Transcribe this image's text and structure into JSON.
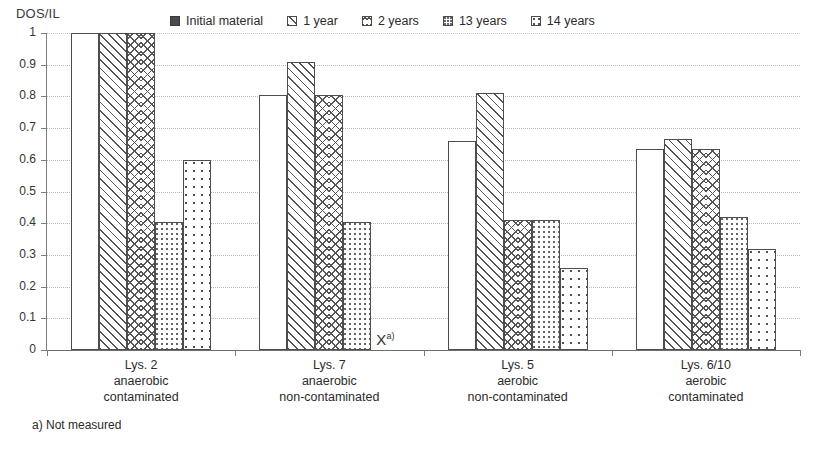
{
  "chart_data": {
    "type": "bar",
    "title": "",
    "ylabel": "DOS/IL",
    "xlabel": "",
    "ylim": [
      0,
      1
    ],
    "ytick_labels": [
      "1",
      "0.9",
      "0.8",
      "0.7",
      "0.6",
      "0.5",
      "0.4",
      "0.3",
      "0.2",
      "0.1",
      "0"
    ],
    "ytick_values": [
      1,
      0.9,
      0.8,
      0.7,
      0.6,
      0.5,
      0.4,
      0.3,
      0.2,
      0.1,
      0
    ],
    "grid": true,
    "grid_style": "dotted-horizontal",
    "legend_position": "top",
    "categories": [
      "Lys. 2 anaerobic contaminated",
      "Lys. 7 anaerobic non-contaminated",
      "Lys. 5 aerobic non-contaminated",
      "Lys. 6/10 aerobic contaminated"
    ],
    "category_lines": [
      [
        "Lys. 2",
        "anaerobic",
        "contaminated"
      ],
      [
        "Lys. 7",
        "anaerobic",
        "non-contaminated"
      ],
      [
        "Lys. 5",
        "aerobic",
        "non-contaminated"
      ],
      [
        "Lys. 6/10",
        "aerobic",
        "contaminated"
      ]
    ],
    "series": [
      {
        "name": "Initial material",
        "pattern": "solid-dark",
        "values": [
          1.0,
          0.805,
          0.66,
          0.635
        ]
      },
      {
        "name": "1 year",
        "pattern": "diagonal-hatch",
        "values": [
          1.0,
          0.91,
          0.81,
          0.665
        ]
      },
      {
        "name": "2 years",
        "pattern": "chevron-hatch",
        "values": [
          1.0,
          0.805,
          0.41,
          0.635
        ]
      },
      {
        "name": "13 years",
        "pattern": "speckle",
        "values": [
          0.405,
          0.405,
          0.41,
          0.42
        ]
      },
      {
        "name": "14 years",
        "pattern": "dots",
        "values": [
          0.6,
          null,
          0.26,
          0.32
        ]
      }
    ],
    "annotations": [
      {
        "text": "X",
        "superscript": "a)",
        "group": "Lys. 7 anaerobic non-contaminated",
        "series": "14 years",
        "meaning": "Not measured"
      }
    ],
    "footnote": "a) Not measured"
  },
  "colors": {
    "axis": "#6e6e6e",
    "grid": "#b9b9b9",
    "bar_outline": "#4d4d4d",
    "series_solid": "#4a4a4a",
    "text": "#2b2b2b",
    "background": "#ffffff"
  }
}
